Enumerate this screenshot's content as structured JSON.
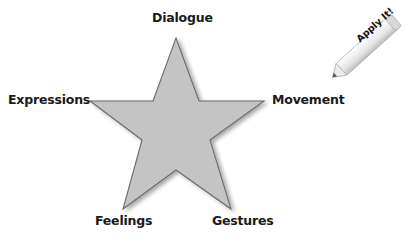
{
  "diagram": {
    "type": "star",
    "center_shape": {
      "fill": "#c4c4c4",
      "stroke": "#6a6a6a"
    },
    "points": {
      "top": "Dialogue",
      "left": "Expressions",
      "right": "Movement",
      "bottom_left": "Feelings",
      "bottom_right": "Gestures"
    }
  },
  "badge": {
    "label": "Apply It!",
    "icon": "pencil-icon"
  }
}
